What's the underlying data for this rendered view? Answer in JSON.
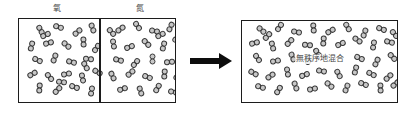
{
  "diagram": {
    "title_left_chamber_label": "氧",
    "title_right_chamber_label": "氮",
    "mixed_caption": "無秩序地混合",
    "arrow_icon": "right-arrow-icon",
    "colors": {
      "molecule_fill": "#c8c8c8",
      "molecule_stroke": "#3a3a3a",
      "vessel_border": "#1c1c1c",
      "arrow": "#0d0d0d",
      "text": "#4a4a4a",
      "background": "#ffffff"
    },
    "labels": [
      {
        "text": "氧",
        "x": 57,
        "y": 4
      },
      {
        "text": "氮",
        "x": 140,
        "y": 4
      }
    ],
    "vessels": [
      {
        "name": "left-apparatus",
        "x": 18,
        "y": 18,
        "w": 158,
        "h": 85
      },
      {
        "name": "right-apparatus",
        "x": 241,
        "y": 20,
        "w": 157,
        "h": 83
      }
    ],
    "divider": {
      "x": 99,
      "y": 19,
      "h": 83
    },
    "arrow": {
      "x": 190,
      "y": 61,
      "shaft_w": 29,
      "total_w": 42
    },
    "caption_position": {
      "x": 320,
      "y": 59
    },
    "molecules_left_chamber": [
      {
        "x": 12,
        "y": 8,
        "r": 62
      },
      {
        "x": 30,
        "y": 5,
        "r": 18
      },
      {
        "x": 49,
        "y": 10,
        "r": -40
      },
      {
        "x": 64,
        "y": 6,
        "r": 70
      },
      {
        "x": 3,
        "y": 24,
        "r": 105
      },
      {
        "x": 20,
        "y": 21,
        "r": -15
      },
      {
        "x": 38,
        "y": 23,
        "r": 40
      },
      {
        "x": 55,
        "y": 20,
        "r": 88
      },
      {
        "x": 68,
        "y": 26,
        "r": -55
      },
      {
        "x": 9,
        "y": 38,
        "r": 25
      },
      {
        "x": 26,
        "y": 36,
        "r": -70
      },
      {
        "x": 43,
        "y": 40,
        "r": 15
      },
      {
        "x": 60,
        "y": 37,
        "r": 5
      },
      {
        "x": 4,
        "y": 52,
        "r": -30
      },
      {
        "x": 21,
        "y": 55,
        "r": 50
      },
      {
        "x": 38,
        "y": 52,
        "r": -10
      },
      {
        "x": 54,
        "y": 56,
        "r": 78
      },
      {
        "x": 69,
        "y": 50,
        "r": 30
      },
      {
        "x": 11,
        "y": 66,
        "r": 95
      },
      {
        "x": 29,
        "y": 68,
        "r": -45
      },
      {
        "x": 46,
        "y": 65,
        "r": 20
      },
      {
        "x": 63,
        "y": 69,
        "r": -80
      },
      {
        "x": 17,
        "y": 13,
        "r": -25
      },
      {
        "x": 57,
        "y": 44,
        "r": 60
      },
      {
        "x": 33,
        "y": 60,
        "r": 8
      }
    ],
    "molecules_right_chamber": [
      {
        "x": 10,
        "y": 7,
        "r": -35
      },
      {
        "x": 27,
        "y": 4,
        "r": 55
      },
      {
        "x": 44,
        "y": 9,
        "r": 10
      },
      {
        "x": 60,
        "y": 5,
        "r": -65
      },
      {
        "x": 3,
        "y": 22,
        "r": 80
      },
      {
        "x": 19,
        "y": 25,
        "r": -20
      },
      {
        "x": 36,
        "y": 21,
        "r": 45
      },
      {
        "x": 53,
        "y": 24,
        "r": -75
      },
      {
        "x": 67,
        "y": 19,
        "r": 30
      },
      {
        "x": 8,
        "y": 38,
        "r": 15
      },
      {
        "x": 25,
        "y": 41,
        "r": -50
      },
      {
        "x": 42,
        "y": 37,
        "r": 90
      },
      {
        "x": 59,
        "y": 40,
        "r": -5
      },
      {
        "x": 2,
        "y": 54,
        "r": 65
      },
      {
        "x": 20,
        "y": 51,
        "r": -40
      },
      {
        "x": 37,
        "y": 55,
        "r": 22
      },
      {
        "x": 54,
        "y": 52,
        "r": -85
      },
      {
        "x": 68,
        "y": 57,
        "r": 35
      },
      {
        "x": 12,
        "y": 67,
        "r": -18
      },
      {
        "x": 30,
        "y": 69,
        "r": 72
      },
      {
        "x": 47,
        "y": 66,
        "r": -60
      },
      {
        "x": 63,
        "y": 70,
        "r": 12
      },
      {
        "x": 1,
        "y": 10,
        "r": 48
      },
      {
        "x": 50,
        "y": 13,
        "r": -28
      }
    ],
    "molecules_mixed": [
      {
        "x": 10,
        "y": 6,
        "r": 40
      },
      {
        "x": 28,
        "y": 3,
        "r": -55
      },
      {
        "x": 45,
        "y": 8,
        "r": 12
      },
      {
        "x": 62,
        "y": 4,
        "r": 85
      },
      {
        "x": 79,
        "y": 7,
        "r": -30
      },
      {
        "x": 96,
        "y": 3,
        "r": 60
      },
      {
        "x": 113,
        "y": 9,
        "r": -70
      },
      {
        "x": 130,
        "y": 5,
        "r": 20
      },
      {
        "x": 143,
        "y": 10,
        "r": 50
      },
      {
        "x": 3,
        "y": 19,
        "r": -15
      },
      {
        "x": 21,
        "y": 22,
        "r": 75
      },
      {
        "x": 38,
        "y": 18,
        "r": -45
      },
      {
        "x": 56,
        "y": 21,
        "r": 5
      },
      {
        "x": 72,
        "y": 17,
        "r": 95
      },
      {
        "x": 89,
        "y": 20,
        "r": -25
      },
      {
        "x": 106,
        "y": 16,
        "r": 35
      },
      {
        "x": 122,
        "y": 21,
        "r": -80
      },
      {
        "x": 138,
        "y": 18,
        "r": 15
      },
      {
        "x": 6,
        "y": 34,
        "r": 55
      },
      {
        "x": 24,
        "y": 37,
        "r": -10
      },
      {
        "x": 41,
        "y": 33,
        "r": 68
      },
      {
        "x": 58,
        "y": 36,
        "r": -50
      },
      {
        "x": 108,
        "y": 34,
        "r": 25
      },
      {
        "x": 125,
        "y": 38,
        "r": -65
      },
      {
        "x": 141,
        "y": 33,
        "r": 45
      },
      {
        "x": 2,
        "y": 49,
        "r": 30
      },
      {
        "x": 19,
        "y": 52,
        "r": -35
      },
      {
        "x": 36,
        "y": 48,
        "r": 80
      },
      {
        "x": 53,
        "y": 51,
        "r": -20
      },
      {
        "x": 70,
        "y": 47,
        "r": 10
      },
      {
        "x": 87,
        "y": 50,
        "r": 62
      },
      {
        "x": 104,
        "y": 46,
        "r": -75
      },
      {
        "x": 120,
        "y": 50,
        "r": 28
      },
      {
        "x": 137,
        "y": 53,
        "r": -42
      },
      {
        "x": 9,
        "y": 63,
        "r": 18
      },
      {
        "x": 27,
        "y": 66,
        "r": -58
      },
      {
        "x": 44,
        "y": 62,
        "r": 70
      },
      {
        "x": 61,
        "y": 65,
        "r": -12
      },
      {
        "x": 78,
        "y": 61,
        "r": 40
      },
      {
        "x": 95,
        "y": 64,
        "r": -68
      },
      {
        "x": 112,
        "y": 60,
        "r": 22
      },
      {
        "x": 129,
        "y": 64,
        "r": 88
      },
      {
        "x": 144,
        "y": 60,
        "r": -38
      },
      {
        "x": 16,
        "y": 12,
        "r": -48
      },
      {
        "x": 66,
        "y": 29,
        "r": 58
      }
    ]
  }
}
